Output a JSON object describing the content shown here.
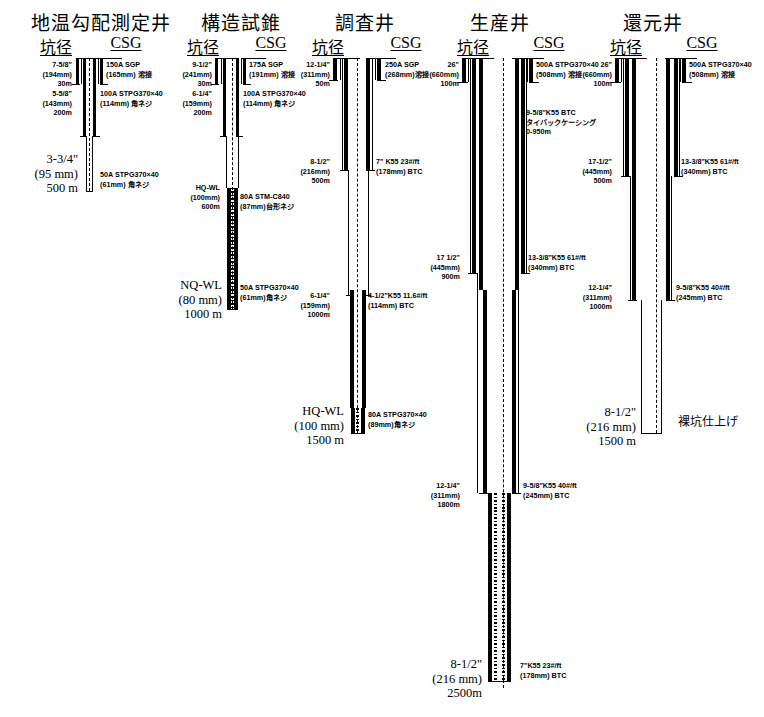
{
  "figure": {
    "kind": "geothermal well casing program schematic",
    "columns": [
      {
        "title": "地温勾配測定井",
        "head_hole": "坑径",
        "head_csg": "CSG",
        "hole_notes": [
          {
            "lines": [
              "7-5/8\"",
              "(194mm)",
              "30m"
            ]
          },
          {
            "lines": [
              "5-5/8\"",
              "(143mm)",
              "200m"
            ]
          },
          {
            "lines": [
              "3-3/4\"",
              "(95 mm)",
              "500 m"
            ],
            "big": true
          }
        ],
        "csg_notes": [
          {
            "lines": [
              "150A SGP",
              "(165mm) 溶接"
            ]
          },
          {
            "lines": [
              "100A STPG370×40",
              "(114mm)  角ネジ"
            ]
          },
          {
            "lines": [
              "50A STPG370×40",
              "(61mm) 角ネジ"
            ]
          }
        ]
      },
      {
        "title": "構造試錐",
        "head_hole": "坑径",
        "head_csg": "CSG",
        "hole_notes": [
          {
            "lines": [
              "9-1/2\"",
              "(241mm)",
              "30m"
            ]
          },
          {
            "lines": [
              "6-1/4\"",
              "(159mm)",
              "200m"
            ]
          },
          {
            "lines": [
              "HQ-WL",
              "(100mm)",
              "600m"
            ]
          },
          {
            "lines": [
              "NQ-WL",
              "(80 mm)",
              "1000 m"
            ],
            "big": true
          }
        ],
        "csg_notes": [
          {
            "lines": [
              "175A SGP",
              "(191mm) 溶接"
            ]
          },
          {
            "lines": [
              "100A STPG370×40",
              "(114mm)  角ネジ"
            ]
          },
          {
            "lines": [
              "80A STM-C840",
              "(87mm)台形ネジ"
            ]
          },
          {
            "lines": [
              "50A STPG370×40",
              "(61mm)角ネジ"
            ]
          }
        ]
      },
      {
        "title": "調査井",
        "head_hole": "坑径",
        "head_csg": "CSG",
        "hole_notes": [
          {
            "lines": [
              "12-1/4\"",
              "(311mm)",
              "50m"
            ]
          },
          {
            "lines": [
              "8-1/2\"",
              "(216mm)",
              "500m"
            ]
          },
          {
            "lines": [
              "6-1/4\"",
              "(159mm)",
              "1000m"
            ]
          },
          {
            "lines": [
              "HQ-WL",
              "(100 mm)",
              "1500 m"
            ],
            "big": true
          }
        ],
        "csg_notes": [
          {
            "lines": [
              "250A SGP",
              "(268mm)溶接"
            ]
          },
          {
            "lines": [
              "7\" K55 23#/ft",
              "(178mm)  BTC"
            ]
          },
          {
            "lines": [
              "4-1/2\"K55 11.6#/ft",
              "(114mm)  BTC"
            ]
          },
          {
            "lines": [
              "80A STPG370×40",
              "(89mm)角ネジ"
            ]
          }
        ]
      },
      {
        "title": "生産井",
        "head_hole": "坑径",
        "head_csg": "CSG",
        "hole_notes": [
          {
            "lines": [
              "26\"",
              "(660mm)",
              "100m"
            ]
          },
          {
            "lines": [
              "17 1/2\"",
              "(445mm)",
              "900m"
            ]
          },
          {
            "lines": [
              "12-1/4\"",
              "(311mm)",
              "1800m"
            ]
          },
          {
            "lines": [
              "8-1/2\"",
              "(216 mm)",
              "2500m"
            ],
            "big": true
          }
        ],
        "csg_notes": [
          {
            "lines": [
              "500A STPG370×40",
              "(508mm) 溶接"
            ]
          },
          {
            "lines": [
              "9-5/8\"K55 BTC",
              "タイバックケーシング",
              "0-950m"
            ]
          },
          {
            "lines": [
              "13-3/8\"K55  61#/ft",
              "(340mm)  BTC"
            ]
          },
          {
            "lines": [
              "9-5/8\"K55 40#/ft",
              "(245mm)  BTC"
            ]
          },
          {
            "lines": [
              "7\"K55 23#/ft",
              "(178mm)  BTC"
            ]
          }
        ]
      },
      {
        "title": "還元井",
        "head_hole": "坑径",
        "head_csg": "CSG",
        "hole_notes": [
          {
            "lines": [
              "26\"",
              "(660mm)",
              "100m"
            ]
          },
          {
            "lines": [
              "17-1/2\"",
              "(445mm)",
              "500m"
            ]
          },
          {
            "lines": [
              "12-1/4\"",
              "(311mm)",
              "1000m"
            ]
          },
          {
            "lines": [
              "8-1/2\"",
              "(216 mm)",
              "1500 m"
            ],
            "big": true
          }
        ],
        "csg_notes": [
          {
            "lines": [
              "500A STPG370×40",
              "(508mm) 溶接"
            ]
          },
          {
            "lines": [
              "13-3/8\"K55  61#/ft",
              "(340mm)  BTC"
            ]
          },
          {
            "lines": [
              "9-5/8\"K55 40#/ft",
              "(245mm)  BTC"
            ]
          }
        ],
        "completion_note": "裸坑仕上げ"
      }
    ]
  },
  "labels": {
    "c1": {
      "title": "地温勾配測定井",
      "hole": "坑径",
      "csg": "CSG",
      "h1a": "7-5/8\"",
      "h1b": "(194mm)",
      "h1c": "30m",
      "h2a": "5-5/8\"",
      "h2b": "(143mm)",
      "h2c": "200m",
      "h3a": "3-3/4\"",
      "h3b": "(95 mm)",
      "h3c": "500 m",
      "c1a": "150A SGP",
      "c1b": "(165mm) 溶接",
      "c2a": "100A STPG370×40",
      "c2b": "(114mm)  角ネジ",
      "c3a": "50A STPG370×40",
      "c3b": "(61mm) 角ネジ"
    },
    "c2": {
      "title": "構造試錐",
      "hole": "坑径",
      "csg": "CSG",
      "h1a": "9-1/2\"",
      "h1b": "(241mm)",
      "h1c": "30m",
      "h2a": "6-1/4\"",
      "h2b": "(159mm)",
      "h2c": "200m",
      "h3a": "HQ-WL",
      "h3b": "(100mm)",
      "h3c": "600m",
      "h4a": "NQ-WL",
      "h4b": "(80 mm)",
      "h4c": "1000 m",
      "c1a": "175A SGP",
      "c1b": "(191mm) 溶接",
      "c2a": "100A STPG370×40",
      "c2b": "(114mm)  角ネジ",
      "c3a": "80A STM-C840",
      "c3b": "(87mm)台形ネジ",
      "c4a": "50A STPG370×40",
      "c4b": "(61mm)角ネジ"
    },
    "c3": {
      "title": "調査井",
      "hole": "坑径",
      "csg": "CSG",
      "h1a": "12-1/4\"",
      "h1b": "(311mm)",
      "h1c": "50m",
      "h2a": "8-1/2\"",
      "h2b": "(216mm)",
      "h2c": "500m",
      "h3a": "6-1/4\"",
      "h3b": "(159mm)",
      "h3c": "1000m",
      "h4a": "HQ-WL",
      "h4b": "(100 mm)",
      "h4c": "1500 m",
      "c1a": "250A SGP",
      "c1b": "(268mm)溶接",
      "c2a": "7\" K55 23#/ft",
      "c2b": "(178mm)  BTC",
      "c3a": "4-1/2\"K55 11.6#/ft",
      "c3b": "(114mm)  BTC",
      "c4a": "80A STPG370×40",
      "c4b": "(89mm)角ネジ"
    },
    "c4": {
      "title": "生産井",
      "hole": "坑径",
      "csg": "CSG",
      "h1a": "26\"",
      "h1b": "(660mm)",
      "h1c": "100m",
      "h2a": "17 1/2\"",
      "h2b": "(445mm)",
      "h2c": "900m",
      "h3a": "12-1/4\"",
      "h3b": "(311mm)",
      "h3c": "1800m",
      "h4a": "8-1/2\"",
      "h4b": "(216 mm)",
      "h4c": "2500m",
      "c1a": "500A STPG370×40",
      "c1b": "(508mm) 溶接",
      "tb1": "9-5/8\"K55 BTC",
      "tb2": "タイバックケーシング",
      "tb3": "0-950m",
      "c2a": "13-3/8\"K55  61#/ft",
      "c2b": "(340mm)  BTC",
      "c3a": "9-5/8\"K55 40#/ft",
      "c3b": "(245mm)  BTC",
      "c4a": "7\"K55 23#/ft",
      "c4b": "(178mm)  BTC"
    },
    "c5": {
      "title": "還元井",
      "hole": "坑径",
      "csg": "CSG",
      "h1a": "26\"",
      "h1b": "(660mm)",
      "h1c": "100m",
      "h2a": "17-1/2\"",
      "h2b": "(445mm)",
      "h2c": "500m",
      "h3a": "12-1/4\"",
      "h3b": "(311mm)",
      "h3c": "1000m",
      "h4a": "8-1/2\"",
      "h4b": "(216 mm)",
      "h4c": "1500 m",
      "c1a": "500A STPG370×40",
      "c1b": "(508mm) 溶接",
      "c2a": "13-3/8\"K55  61#/ft",
      "c2b": "(340mm)  BTC",
      "c3a": "9-5/8\"K55 40#/ft",
      "c3b": "(245mm)  BTC",
      "open": "裸坑仕上げ"
    }
  }
}
